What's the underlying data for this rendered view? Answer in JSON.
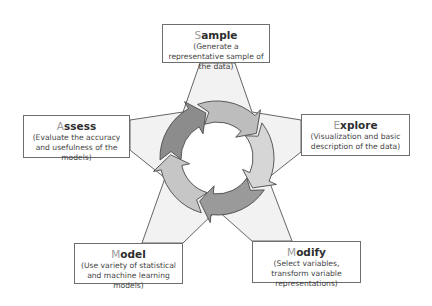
{
  "diagram": {
    "stages": [
      {
        "id": "sample",
        "first_letter": "S",
        "rest": "ample",
        "description": "(Generate a representative sample of the data)"
      },
      {
        "id": "explore",
        "first_letter": "E",
        "rest": "xplore",
        "description": "(Visualization and basic description of the data)"
      },
      {
        "id": "modify",
        "first_letter": "M",
        "rest": "odify",
        "description": "(Select variables, transform variable representations)"
      },
      {
        "id": "model",
        "first_letter": "M",
        "rest": "odel",
        "description": "(Use variety of statistical and machine learning models)"
      },
      {
        "id": "assess",
        "first_letter": "A",
        "rest": "ssess",
        "description": "(Evaluate the accuracy and usefulness of the models)"
      }
    ],
    "cycle_direction": "clockwise",
    "colors": {
      "star_fill": "#f2f2f2",
      "star_stroke": "#555555",
      "arrow_stroke": "#4a4a4a",
      "arrow_fills": [
        "#bdbdbd",
        "#d6d6d6",
        "#9a9a9a",
        "#c6c6c6",
        "#8c8c8c"
      ]
    }
  }
}
